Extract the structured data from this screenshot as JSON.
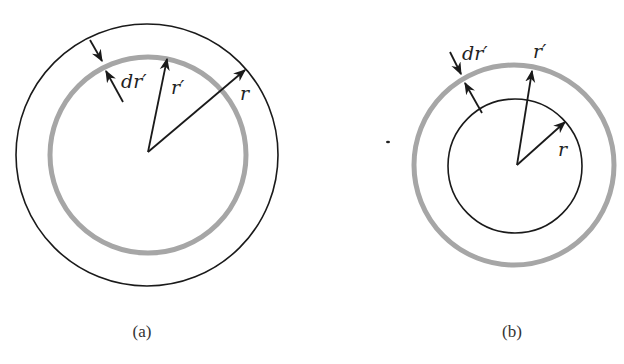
{
  "figure": {
    "colors": {
      "ink": "#1a1a1a",
      "shell": "#a6a6a6",
      "background": "#ffffff"
    },
    "panels": [
      {
        "id": "a",
        "caption": "(a)",
        "center": [
          148,
          155
        ],
        "circles": [
          {
            "role": "outer-boundary-r",
            "radius": 131,
            "style": "thin-black"
          },
          {
            "role": "shell-r-prime",
            "radius": 98,
            "style": "thick-gray"
          }
        ],
        "arrows": [
          {
            "label": "r′",
            "from": [
              148,
              152
            ],
            "to": [
              167,
              59
            ]
          },
          {
            "label": "r",
            "from": [
              148,
              152
            ],
            "to": [
              245,
              70
            ]
          },
          {
            "label": "dr′ (outer)",
            "from": [
              90,
              40
            ],
            "to": [
              102,
              61
            ]
          },
          {
            "label": "dr′ (inner)",
            "from": [
              123,
              102
            ],
            "to": [
              106,
              71
            ]
          }
        ],
        "labels": {
          "dr_prime": "dr′",
          "r_prime": "r′",
          "r": "r"
        }
      },
      {
        "id": "b",
        "caption": "(b)",
        "center": [
          516,
          165
        ],
        "circles": [
          {
            "role": "shell-r-prime",
            "radius": 100,
            "style": "thick-gray"
          },
          {
            "role": "inner-boundary-r",
            "radius": 67,
            "style": "thin-black"
          }
        ],
        "arrows": [
          {
            "label": "r′",
            "from": [
              517,
              165
            ],
            "to": [
              532,
              71
            ]
          },
          {
            "label": "r",
            "from": [
              517,
              165
            ],
            "to": [
              565,
              122
            ]
          },
          {
            "label": "dr′ (outer)",
            "from": [
              450,
              52
            ],
            "to": [
              461,
              74
            ]
          },
          {
            "label": "dr′ (inner)",
            "from": [
              482,
              113
            ],
            "to": [
              465,
              83
            ]
          }
        ],
        "labels": {
          "dr_prime": "dr′",
          "r_prime": "r′",
          "r": "r"
        }
      }
    ]
  }
}
